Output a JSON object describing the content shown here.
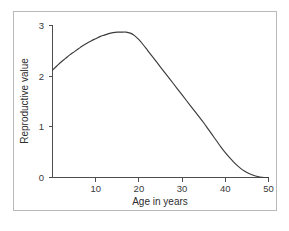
{
  "figure": {
    "background_color": "#ffffff",
    "frame_color": "#b9b9b9",
    "axis_color": "#4d4d4d",
    "curve_color": "#3b3b3b"
  },
  "chart_data": {
    "type": "line",
    "title": "",
    "subtitle": "",
    "xlabel": "Age in years",
    "ylabel": "Reproductive value",
    "xlim": [
      0,
      50
    ],
    "ylim": [
      0,
      3
    ],
    "grid": false,
    "legend": null,
    "legend_position": "none",
    "xticks": [
      10,
      20,
      30,
      40,
      50
    ],
    "xtick_labels": [
      "10",
      "20",
      "30",
      "40",
      "50"
    ],
    "yticks": [
      0,
      1,
      2,
      3
    ],
    "ytick_labels": [
      "0",
      "1",
      "2",
      "3"
    ],
    "series": [
      {
        "name": "Reproductive value",
        "color": "#3b3b3b",
        "x": [
          0,
          1,
          2,
          3,
          4,
          5,
          6,
          7,
          8,
          9,
          10,
          11,
          12,
          13,
          14,
          15,
          16,
          17,
          18,
          19,
          20,
          21,
          22,
          23,
          24,
          25,
          26,
          27,
          28,
          29,
          30,
          31,
          32,
          33,
          34,
          35,
          36,
          37,
          38,
          39,
          40,
          41,
          42,
          43,
          44,
          45,
          46,
          47,
          48,
          49,
          50
        ],
        "y": [
          2.12,
          2.2,
          2.28,
          2.35,
          2.42,
          2.48,
          2.54,
          2.6,
          2.65,
          2.7,
          2.74,
          2.78,
          2.81,
          2.84,
          2.86,
          2.87,
          2.87,
          2.87,
          2.85,
          2.8,
          2.72,
          2.62,
          2.51,
          2.4,
          2.29,
          2.18,
          2.07,
          1.96,
          1.85,
          1.74,
          1.63,
          1.52,
          1.41,
          1.3,
          1.19,
          1.08,
          0.96,
          0.84,
          0.72,
          0.6,
          0.49,
          0.39,
          0.3,
          0.22,
          0.15,
          0.1,
          0.06,
          0.03,
          0.01,
          0.0,
          0.0
        ]
      }
    ],
    "annotations": []
  }
}
